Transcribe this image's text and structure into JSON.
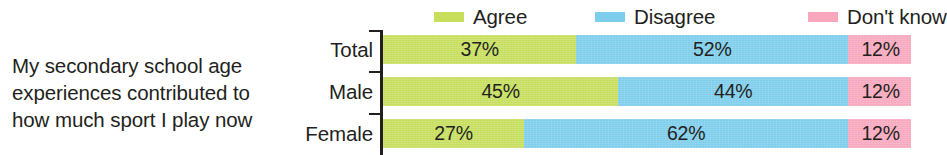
{
  "question": {
    "lines": [
      "My secondary school age",
      "experiences contributed to",
      "how much sport I play now"
    ]
  },
  "legend": {
    "items": [
      {
        "label": "Agree",
        "color": "#c6de5c"
      },
      {
        "label": "Disagree",
        "color": "#7dcdec"
      },
      {
        "label": "Don't know",
        "color": "#f8a7bd"
      }
    ]
  },
  "chart_data": {
    "type": "bar",
    "orientation": "horizontal",
    "stacked": true,
    "title": "My secondary school age experiences contributed to how much sport I play now",
    "xlabel": "",
    "ylabel": "",
    "xlim": [
      0,
      101
    ],
    "grid": false,
    "legend_position": "top",
    "value_format": "percent",
    "categories": [
      "Total",
      "Male",
      "Female"
    ],
    "series": [
      {
        "name": "Agree",
        "color": "#c6de5c",
        "values": [
          37,
          45,
          27
        ],
        "labels": [
          "37%",
          "45%",
          "27%"
        ]
      },
      {
        "name": "Disagree",
        "color": "#7dcdec",
        "values": [
          52,
          44,
          62
        ],
        "labels": [
          "52%",
          "44%",
          "62%"
        ]
      },
      {
        "name": "Don't know",
        "color": "#f8a7bd",
        "values": [
          12,
          12,
          12
        ],
        "labels": [
          "12%",
          "12%",
          "12%"
        ]
      }
    ],
    "rows": [
      {
        "category": "Total",
        "segments": [
          {
            "series": "Agree",
            "value": 37,
            "label": "37%"
          },
          {
            "series": "Disagree",
            "value": 52,
            "label": "52%"
          },
          {
            "series": "Don't know",
            "value": 12,
            "label": "12%"
          }
        ]
      },
      {
        "category": "Male",
        "segments": [
          {
            "series": "Agree",
            "value": 45,
            "label": "45%"
          },
          {
            "series": "Disagree",
            "value": 44,
            "label": "44%"
          },
          {
            "series": "Don't know",
            "value": 12,
            "label": "12%"
          }
        ]
      },
      {
        "category": "Female",
        "segments": [
          {
            "series": "Agree",
            "value": 27,
            "label": "27%"
          },
          {
            "series": "Disagree",
            "value": 62,
            "label": "62%"
          },
          {
            "series": "Don't know",
            "value": 12,
            "label": "12%"
          }
        ]
      }
    ]
  },
  "colors": {
    "agree": "#c6de5c",
    "disagree": "#7dcdec",
    "dontknow": "#f8a7bd",
    "axis": "#231f20",
    "text": "#231f20",
    "background": "#ffffff"
  }
}
